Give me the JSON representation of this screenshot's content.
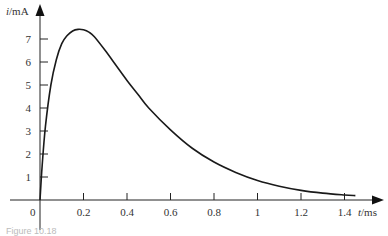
{
  "chart_data": {
    "type": "line",
    "title": "",
    "xlabel": "t/ms",
    "ylabel": "i/mA",
    "xlim": [
      0,
      1.45
    ],
    "ylim": [
      0,
      7.6
    ],
    "x_ticks": [
      0.2,
      0.4,
      0.6,
      0.8,
      1,
      1.2,
      1.4
    ],
    "x_tick_labels": [
      "0.2",
      "0.4",
      "0.6",
      "0.8",
      "1",
      "1.2",
      "1.4"
    ],
    "y_ticks": [
      1,
      2,
      3,
      4,
      5,
      6,
      7
    ],
    "y_tick_labels": [
      "1",
      "2",
      "3",
      "4",
      "5",
      "6",
      "7"
    ],
    "origin_label": "0",
    "grid": false,
    "legend": null,
    "series": [
      {
        "name": "i(t)",
        "color": "#1a1a1a",
        "x": [
          0,
          0.01,
          0.025,
          0.05,
          0.075,
          0.1,
          0.125,
          0.15,
          0.175,
          0.2,
          0.225,
          0.25,
          0.3,
          0.35,
          0.4,
          0.45,
          0.5,
          0.6,
          0.7,
          0.8,
          0.9,
          1.0,
          1.1,
          1.2,
          1.3,
          1.4,
          1.45
        ],
        "values": [
          0,
          1.5,
          3.2,
          5.0,
          6.1,
          6.8,
          7.15,
          7.35,
          7.42,
          7.4,
          7.3,
          7.1,
          6.5,
          5.85,
          5.2,
          4.6,
          4.0,
          3.05,
          2.25,
          1.65,
          1.2,
          0.85,
          0.6,
          0.42,
          0.3,
          0.22,
          0.19
        ]
      }
    ]
  },
  "caption": "Figure 10.18"
}
